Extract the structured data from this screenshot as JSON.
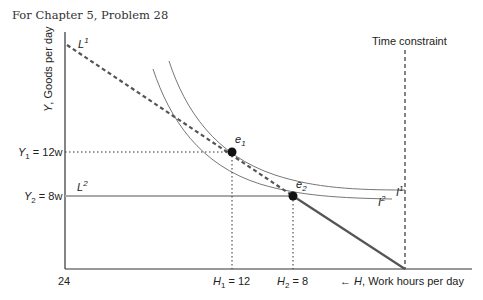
{
  "caption": "For Chapter 5, Problem 28",
  "axes": {
    "y_label_var": "Y",
    "y_label_rest": ", Goods per day",
    "x_origin": "24",
    "x_label_var": "H",
    "x_label_rest": ", Work hours per day",
    "x_arrow": "←"
  },
  "time_constraint": "Time constraint",
  "budget_lines": {
    "L1": {
      "base": "L",
      "sup": "1"
    },
    "L2": {
      "base": "L",
      "sup": "2"
    }
  },
  "indifference_curves": {
    "I1": {
      "base": "I",
      "sup": "1"
    },
    "I2": {
      "base": "I",
      "sup": "2"
    }
  },
  "equilibria": {
    "e1": {
      "base": "e",
      "sub": "1"
    },
    "e2": {
      "base": "e",
      "sub": "2"
    }
  },
  "y_ticks": {
    "y1": {
      "var": "Y",
      "sub": "1",
      "rest": " = 12w"
    },
    "y2": {
      "var": "Y",
      "sub": "2",
      "rest": " = 8w"
    }
  },
  "x_ticks": {
    "h1": {
      "var": "H",
      "sub": "1",
      "rest": " = 12"
    },
    "h2": {
      "var": "H",
      "sub": "2",
      "rest": " = 8"
    }
  },
  "colors": {
    "axis": "#333333",
    "budget_L1": "#555555",
    "budget_L2": "#a0a0a0",
    "kinked_segment": "#555555",
    "curves": "#666666"
  }
}
